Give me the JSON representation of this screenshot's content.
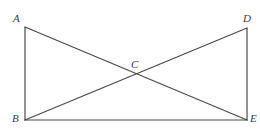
{
  "figure": {
    "background_color": "#ffffff",
    "stroke_color": "#4a4a4a",
    "label_color": "#3a3a3a",
    "stroke_width": 1.2,
    "vertices": [
      {
        "id": "A",
        "label": "A",
        "x": 25,
        "y": 27,
        "label_x": 13,
        "label_y": 13
      },
      {
        "id": "D",
        "label": "D",
        "x": 247,
        "y": 28,
        "label_x": 243,
        "label_y": 13
      },
      {
        "id": "B",
        "label": "B",
        "x": 25,
        "y": 120,
        "label_x": 12,
        "label_y": 113
      },
      {
        "id": "E",
        "label": "E",
        "x": 247,
        "y": 120,
        "label_x": 250,
        "label_y": 113
      },
      {
        "id": "C",
        "label": "C",
        "x": 136,
        "y": 74,
        "label_x": 131,
        "label_y": 59
      }
    ],
    "segments": [
      {
        "name": "side-AB",
        "from": "A",
        "to": "B"
      },
      {
        "name": "side-BE",
        "from": "B",
        "to": "E"
      },
      {
        "name": "side-DE",
        "from": "D",
        "to": "E"
      },
      {
        "name": "side-AD",
        "from": "A",
        "to": "D"
      },
      {
        "name": "diagonal-AE",
        "from": "A",
        "to": "E"
      },
      {
        "name": "diagonal-BD",
        "from": "B",
        "to": "D"
      }
    ],
    "intersection_point": "C"
  }
}
